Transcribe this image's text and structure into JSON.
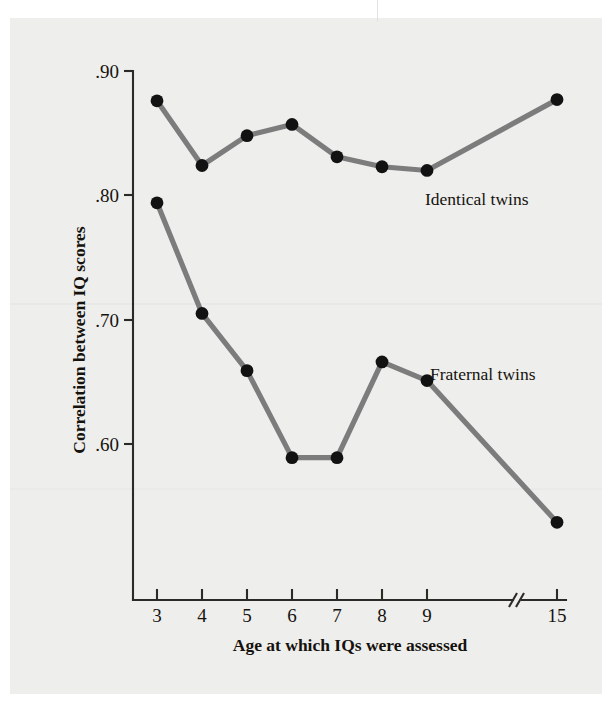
{
  "figure": {
    "background_color": "#eeeeec",
    "ink_color": "#2c2a27",
    "line_color": "#7c7c7c",
    "point_color": "#121212"
  },
  "chart_data": {
    "type": "line",
    "title": "",
    "xlabel": "Age at which IQs were assessed",
    "ylabel": "Correlation between IQ scores",
    "x": [
      3,
      4,
      5,
      6,
      7,
      8,
      9,
      15
    ],
    "x_tick_labels": [
      "3",
      "4",
      "5",
      "6",
      "7",
      "8",
      "9",
      "15"
    ],
    "y_tick_labels": [
      ".90",
      ".80",
      ".70",
      ".60"
    ],
    "y_tick_values": [
      0.9,
      0.8,
      0.7,
      0.6
    ],
    "ylim": [
      0.52,
      0.905
    ],
    "grid": false,
    "legend_position": "inline-annotation",
    "axis_break": {
      "between": [
        9,
        15
      ],
      "style": "double-slash"
    },
    "series": [
      {
        "name": "Identical twins",
        "label": "Identical twins",
        "values": [
          0.876,
          0.824,
          0.848,
          0.857,
          0.831,
          0.823,
          0.82,
          0.877
        ]
      },
      {
        "name": "Fraternal twins",
        "label": "Fraternal twins",
        "values": [
          0.794,
          0.705,
          0.659,
          0.589,
          0.589,
          0.666,
          0.651,
          0.537
        ]
      }
    ],
    "annotations": [
      {
        "text": "Identical twins",
        "x": 9,
        "y": 0.79
      },
      {
        "text": "Fraternal twins",
        "x": 9,
        "y": 0.665
      }
    ]
  }
}
